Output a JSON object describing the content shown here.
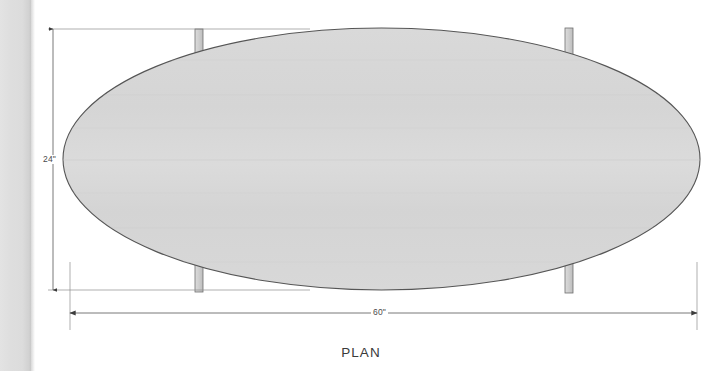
{
  "drawing": {
    "view_title": "PLAN",
    "object_name": "elliptical-table-top",
    "dimensions": {
      "height_label": "24\"",
      "width_label": "60\""
    },
    "colors": {
      "tabletop_fill": "#d6d6d6",
      "tabletop_outline": "#555555",
      "leg_fill": "#c9c9c9",
      "leg_outline": "#6e6e6e",
      "dimension_line": "#6a6a6a",
      "extension_line": "#8c8c8c",
      "text": "#4a4a4a",
      "page_background": "#ffffff",
      "page_edge_strip": "#dedede"
    },
    "geometry": {
      "ellipse_center_x": 381.5,
      "ellipse_center_y": 159,
      "ellipse_radius_x": 318.5,
      "ellipse_radius_y": 131,
      "legs": [
        {
          "name": "leg-top-left",
          "x": 195,
          "y": 29,
          "width": 8,
          "height": 48
        },
        {
          "name": "leg-top-right",
          "x": 565,
          "y": 28,
          "width": 8,
          "height": 48
        },
        {
          "name": "leg-bottom-left",
          "x": 195,
          "y": 252,
          "width": 8,
          "height": 40
        },
        {
          "name": "leg-bottom-right",
          "x": 565,
          "y": 248,
          "width": 8,
          "height": 45
        }
      ],
      "height_dimension": {
        "x": 53,
        "y_top": 29,
        "y_bottom": 290
      },
      "width_dimension": {
        "y": 313,
        "x_left": 70,
        "x_right": 697
      }
    }
  }
}
